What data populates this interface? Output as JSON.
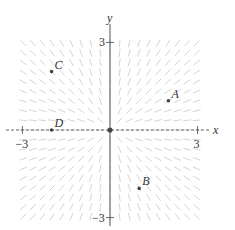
{
  "figure": {
    "type": "slope-field",
    "differential_equation": "dy/dx = y/x",
    "axis_labels": {
      "x": "x",
      "y": "y"
    },
    "x_ticks": [
      {
        "value": -3,
        "label": "−3"
      },
      {
        "value": 3,
        "label": "3"
      }
    ],
    "y_ticks": [
      {
        "value": 3,
        "label": "3"
      },
      {
        "value": -3,
        "label": "−3"
      }
    ],
    "xlim": [
      -3.3,
      3.3
    ],
    "ylim": [
      -3.3,
      3.3
    ],
    "grid_step": 0.33,
    "colors": {
      "segment": "#cfcfcf",
      "axis": "#555555",
      "point": "#444444",
      "text": "#333333"
    },
    "points": [
      {
        "label": "A",
        "x": 2,
        "y": 1
      },
      {
        "label": "B",
        "x": 1,
        "y": -2
      },
      {
        "label": "C",
        "x": -2,
        "y": 2
      },
      {
        "label": "D",
        "x": -2,
        "y": 0
      }
    ]
  },
  "chart_data": {
    "type": "slope-field",
    "title": "",
    "xlabel": "x",
    "ylabel": "y",
    "xlim": [
      -3.3,
      3.3
    ],
    "ylim": [
      -3.3,
      3.3
    ],
    "x_tick_labels": [
      "−3",
      "3"
    ],
    "y_tick_labels": [
      "3",
      "−3"
    ],
    "slope_function": "y/x",
    "points": [
      {
        "label": "A",
        "x": 2,
        "y": 1
      },
      {
        "label": "B",
        "x": 1,
        "y": -2
      },
      {
        "label": "C",
        "x": -2,
        "y": 2
      },
      {
        "label": "D",
        "x": -2,
        "y": 0
      }
    ],
    "grid": false
  }
}
